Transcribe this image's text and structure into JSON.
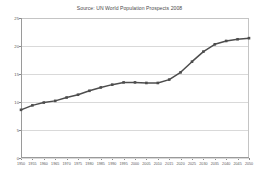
{
  "chart_data": {
    "type": "line",
    "title": "Source: UN World Population Prospects 2008",
    "xlabel": "",
    "ylabel": "",
    "x": [
      1950,
      1955,
      1960,
      1965,
      1970,
      1975,
      1980,
      1985,
      1990,
      1995,
      2000,
      2005,
      2010,
      2015,
      2020,
      2025,
      2030,
      2035,
      2040,
      2045,
      2050
    ],
    "categories": [
      "1950",
      "1955",
      "1960",
      "1965",
      "1970",
      "1975",
      "1980",
      "1985",
      "1990",
      "1995",
      "2000",
      "2005",
      "2010",
      "2015",
      "2020",
      "2025",
      "2030",
      "2035",
      "2040",
      "2045",
      "2050"
    ],
    "values": [
      8.6,
      9.4,
      9.9,
      10.2,
      10.8,
      11.3,
      12.0,
      12.6,
      13.1,
      13.5,
      13.5,
      13.4,
      13.4,
      14.0,
      15.3,
      17.2,
      19.0,
      20.3,
      20.9,
      21.2,
      21.4
    ],
    "series": [
      {
        "name": "Population",
        "values": [
          8.6,
          9.4,
          9.9,
          10.2,
          10.8,
          11.3,
          12.0,
          12.6,
          13.1,
          13.5,
          13.5,
          13.4,
          13.4,
          14.0,
          15.3,
          17.2,
          19.0,
          20.3,
          20.9,
          21.2,
          21.4
        ]
      }
    ],
    "ylim": [
      0,
      25
    ],
    "xlim": [
      1950,
      2050
    ],
    "yticks": [
      0,
      5,
      10,
      15,
      20,
      25
    ],
    "ytick_labels": [
      "0",
      "5",
      "10",
      "15",
      "20",
      "25"
    ],
    "grid": true,
    "grid_axis": "y",
    "legend": "none",
    "line_color": "#4d4d4d",
    "marker_color": "#4d4d4d",
    "marker_shape": "square",
    "grid_color": "#d9d9d9",
    "axis_color": "#9a9a9a",
    "background_color": "#ffffff",
    "text_color": "#595959"
  }
}
